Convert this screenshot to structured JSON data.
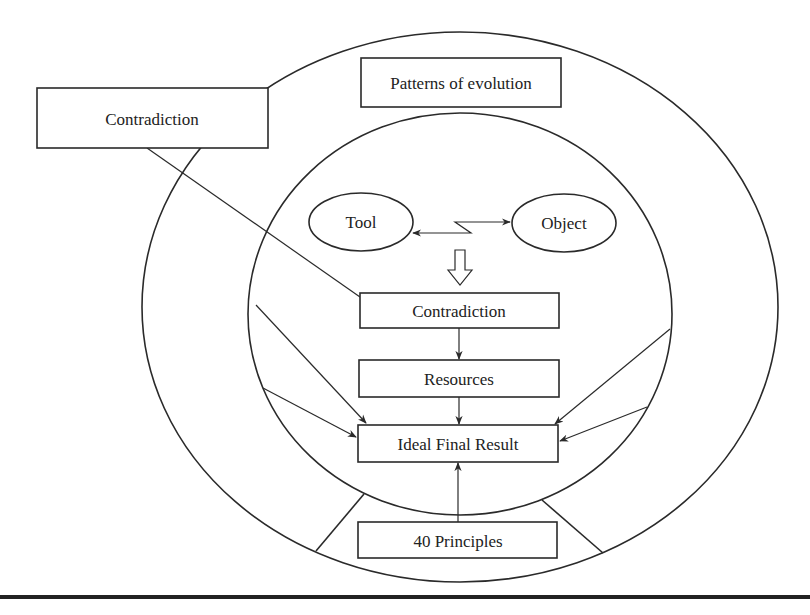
{
  "diagram": {
    "outer_ring": {
      "label_box_left": "Contradiction",
      "label_box_top": "Patterns of evolution"
    },
    "inner_circle": {
      "tool": "Tool",
      "object": "Object",
      "contradiction": "Contradiction",
      "resources": "Resources",
      "ideal_final_result": "Ideal Final Result"
    },
    "bottom_segment": {
      "principles": "40 Principles"
    },
    "connections": [
      {
        "from": "Tool",
        "to": "Object",
        "type": "bidirectional lightning"
      },
      {
        "from": "Tool/Object interaction",
        "to": "Contradiction",
        "type": "hollow arrow"
      },
      {
        "from": "Contradiction (outer)",
        "to": "Contradiction (inner)",
        "type": "line"
      },
      {
        "from": "Contradiction",
        "to": "Resources",
        "type": "arrow"
      },
      {
        "from": "Resources",
        "to": "Ideal Final Result",
        "type": "arrow"
      },
      {
        "from": "40 Principles",
        "to": "Ideal Final Result",
        "type": "arrow"
      },
      {
        "from": "inner circle left",
        "to": "Ideal Final Result",
        "type": "arrow x2"
      },
      {
        "from": "inner circle right",
        "to": "Ideal Final Result",
        "type": "arrow x2"
      }
    ]
  }
}
